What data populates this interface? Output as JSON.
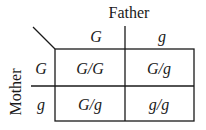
{
  "diagram": {
    "type": "punnett-square",
    "column_header_title": "Father",
    "row_header_title": "Mother",
    "columns": [
      "G",
      "g"
    ],
    "rows": [
      "G",
      "g"
    ],
    "cells": [
      [
        "G/G",
        "G/g"
      ],
      [
        "G/g",
        "g/g"
      ]
    ],
    "line_color": "#1a1a1a"
  }
}
